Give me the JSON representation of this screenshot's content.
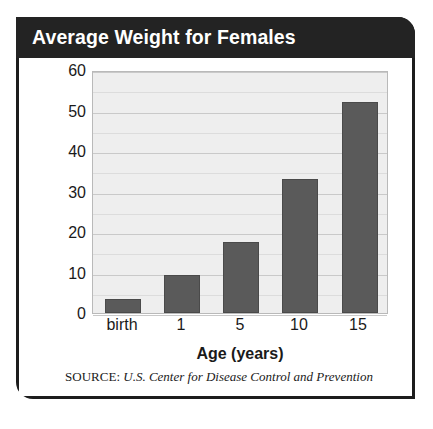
{
  "header": {
    "title": "Average Weight for Females",
    "background_color": "#232323",
    "text_color": "#ffffff"
  },
  "source": {
    "prefix": "SOURCE:",
    "text": "U.S. Center for Disease Control and Prevention"
  },
  "chart_data": {
    "type": "bar",
    "title": "Average Weight for Females",
    "subtitle": "",
    "xlabel": "Age (years)",
    "ylabel": "Weight (kilograms)",
    "categories": [
      "birth",
      "1",
      "5",
      "10",
      "15"
    ],
    "values": [
      3.5,
      9.5,
      17.5,
      33,
      52
    ],
    "ylim": [
      0,
      60
    ],
    "ytick_labels": [
      "0",
      "10",
      "20",
      "30",
      "40",
      "50",
      "60"
    ],
    "ytick_values": [
      0,
      10,
      20,
      30,
      40,
      50,
      60
    ],
    "minor_tick_interval": 5,
    "grid": true,
    "legend": "none",
    "bar_color": "#5a5a5a",
    "plot_background_color": "#eeeeee",
    "gridline_color": "#c9c9c9",
    "annotations": [
      "SOURCE: U.S. Center for Disease Control and Prevention"
    ]
  }
}
